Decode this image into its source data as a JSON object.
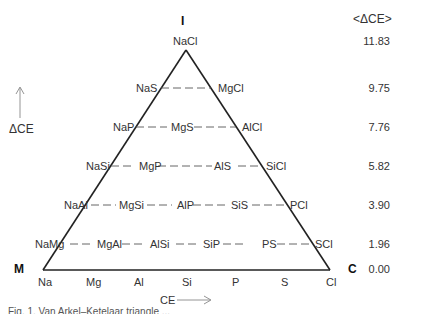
{
  "figure": {
    "corner_labels": {
      "top": "I",
      "left": "M",
      "right": "C"
    },
    "header": "<ΔCE>",
    "y_axis_label": "ΔCE",
    "x_axis_label": "CE",
    "rows": [
      {
        "delta_ce": "11.83",
        "items": [
          "NaCl"
        ]
      },
      {
        "delta_ce": "9.75",
        "items": [
          "NaS",
          "MgCl"
        ]
      },
      {
        "delta_ce": "7.76",
        "items": [
          "NaP",
          "MgS",
          "AlCl"
        ]
      },
      {
        "delta_ce": "5.82",
        "items": [
          "NaSi",
          "MgP",
          "AlS",
          "SiCl"
        ]
      },
      {
        "delta_ce": "3.90",
        "items": [
          "NaAl",
          "MgSi",
          "AlP",
          "SiS",
          "PCl"
        ]
      },
      {
        "delta_ce": "1.96",
        "items": [
          "NaMg",
          "MgAl",
          "AlSi",
          "SiP",
          "PS",
          "SCl"
        ]
      },
      {
        "delta_ce": "0.00",
        "items": [
          "Na",
          "Mg",
          "Al",
          "Si",
          "P",
          "S",
          "Cl"
        ]
      }
    ],
    "caption": "Fig. 1. Van Arkel–Ketelaar triangle ..."
  }
}
